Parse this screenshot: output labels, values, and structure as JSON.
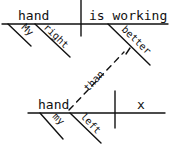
{
  "diagram": {
    "type": "sentence-diagram",
    "main_clause": {
      "subject": "hand",
      "verb": "is working",
      "subject_modifiers": [
        "My",
        "right"
      ],
      "verb_modifier": "better"
    },
    "connector": "than",
    "sub_clause": {
      "subject": "hand",
      "verb": "x",
      "subject_modifiers": [
        "my",
        "left"
      ]
    }
  }
}
